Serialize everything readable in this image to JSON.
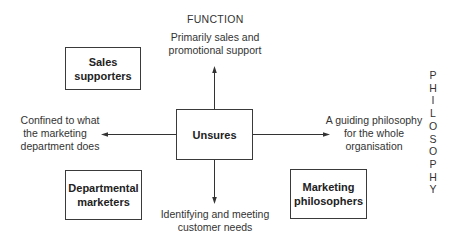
{
  "diagram": {
    "axes": {
      "vertical_title": "FUNCTION",
      "horizontal_title_letters": [
        "P",
        "H",
        "I",
        "L",
        "O",
        "S",
        "O",
        "P",
        "H",
        "Y"
      ]
    },
    "center": {
      "label": "Unsures"
    },
    "quadrants": [
      {
        "id": "top-left",
        "label_line1": "Sales",
        "label_line2": "supporters"
      },
      {
        "id": "bottom-left",
        "label_line1": "Departmental",
        "label_line2": "marketers"
      },
      {
        "id": "bottom-right",
        "label_line1": "Marketing",
        "label_line2": "philosophers"
      }
    ],
    "arrow_labels": {
      "up": {
        "line1": "Primarily sales and",
        "line2": "promotional support"
      },
      "down": {
        "line1": "Identifying and meeting",
        "line2": "customer needs"
      },
      "left": {
        "line1": "Confined to what",
        "line2": "the marketing",
        "line3": "department does"
      },
      "right": {
        "line1": "A guiding philosophy",
        "line2": "for the whole",
        "line3": "organisation"
      }
    },
    "colors": {
      "line": "#333333",
      "text": "#2a2a2a",
      "background": "#ffffff"
    }
  }
}
